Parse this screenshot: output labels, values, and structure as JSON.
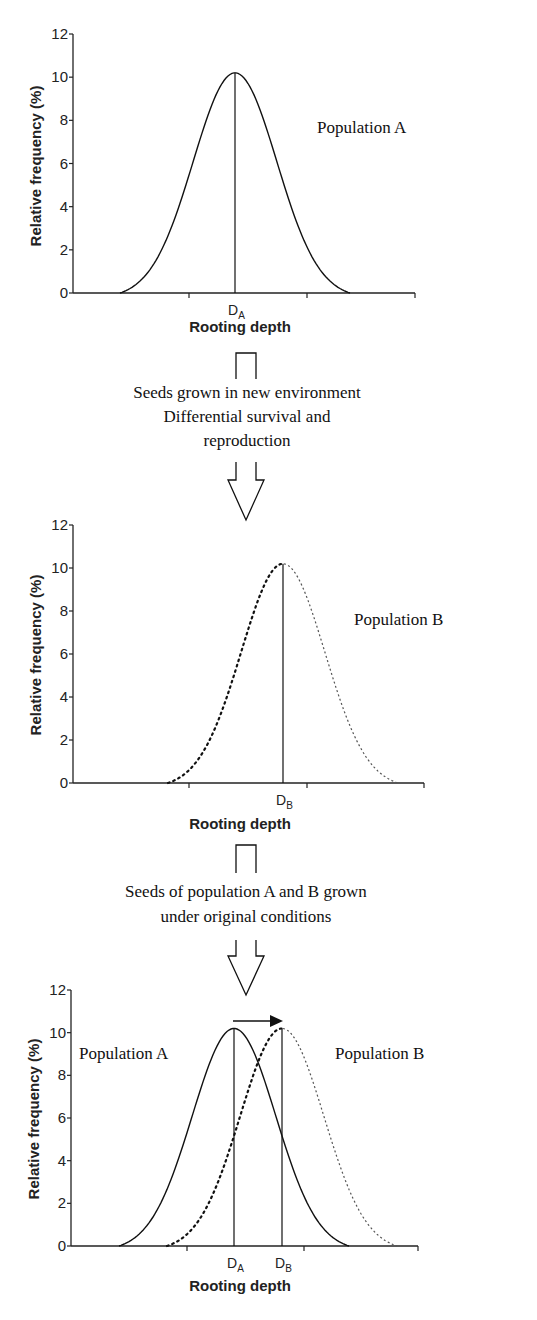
{
  "chart_data": [
    {
      "type": "line",
      "title": "",
      "xlabel": "Rooting depth",
      "ylabel": "Relative frequency (%)",
      "ylim": [
        0,
        12
      ],
      "yticks": [
        0,
        2,
        4,
        6,
        8,
        10,
        12
      ],
      "grid": false,
      "annotations": [
        "Population A"
      ],
      "x_marker_labels": [
        {
          "label": "D",
          "sub": "A"
        }
      ],
      "series": [
        {
          "name": "Population A",
          "style": "solid",
          "mean_label": "DA",
          "peak": 10.2,
          "x": [
            -4,
            -3,
            -2,
            -1,
            0,
            1,
            2,
            3,
            4
          ],
          "values": [
            0,
            1.2,
            4.0,
            8.0,
            10.2,
            8.0,
            4.0,
            1.2,
            0
          ]
        }
      ]
    },
    {
      "type": "line",
      "title": "",
      "xlabel": "Rooting depth",
      "ylabel": "Relative frequency (%)",
      "ylim": [
        0,
        12
      ],
      "yticks": [
        0,
        2,
        4,
        6,
        8,
        10,
        12
      ],
      "grid": false,
      "annotations": [
        "Population B"
      ],
      "x_marker_labels": [
        {
          "label": "D",
          "sub": "B"
        }
      ],
      "series": [
        {
          "name": "Population B",
          "style": "dotted",
          "mean_label": "DB",
          "peak": 10.2,
          "x": [
            -4,
            -3,
            -2,
            -1,
            0,
            1,
            2,
            3,
            4
          ],
          "values": [
            0,
            1.2,
            4.0,
            8.0,
            10.2,
            8.0,
            4.0,
            1.2,
            0
          ]
        }
      ]
    },
    {
      "type": "line",
      "title": "",
      "xlabel": "Rooting depth",
      "ylabel": "Relative frequency (%)",
      "ylim": [
        0,
        12
      ],
      "yticks": [
        0,
        2,
        4,
        6,
        8,
        10,
        12
      ],
      "grid": false,
      "annotations": [
        "Population A",
        "Population B",
        "arrow: shift from DA to DB"
      ],
      "x_marker_labels": [
        {
          "label": "D",
          "sub": "A"
        },
        {
          "label": "D",
          "sub": "B"
        }
      ],
      "series": [
        {
          "name": "Population A",
          "style": "solid",
          "mean_label": "DA",
          "peak": 10.2,
          "values": [
            0,
            1.2,
            4.0,
            8.0,
            10.2,
            8.0,
            4.0,
            1.2,
            0
          ]
        },
        {
          "name": "Population B",
          "style": "dotted",
          "mean_label": "DB",
          "peak": 10.2,
          "values": [
            0,
            1.2,
            4.0,
            8.0,
            10.2,
            8.0,
            4.0,
            1.2,
            0
          ]
        }
      ]
    }
  ],
  "labels": {
    "ylabel": "Relative frequency (%)",
    "xlabel": "Rooting depth",
    "yticks": [
      "0",
      "2",
      "4",
      "6",
      "8",
      "10",
      "12"
    ],
    "population_a": "Population A",
    "population_b": "Population B",
    "d": "D",
    "sub_a": "A",
    "sub_b": "B"
  },
  "captions": {
    "step1": [
      "Seeds grown in new environment",
      "Differential survival and",
      "reproduction"
    ],
    "step2": [
      "Seeds of population A and B grown",
      "under original conditions"
    ]
  },
  "layout": {
    "charts": [
      {
        "axis_x": 73,
        "x_end": 415,
        "y0": 293,
        "y12": 34,
        "ticks_x": [
          189,
          307
        ],
        "curves": [
          {
            "center": 235,
            "half_width": 115,
            "style": "solid"
          }
        ],
        "means": [
          {
            "x": 235,
            "sub": "A"
          }
        ],
        "label": {
          "text_key": "population_a",
          "x": 317,
          "y": 133
        },
        "xlabel_y": 332
      },
      {
        "axis_x": 73,
        "x_end": 424,
        "y0": 783,
        "y12": 525,
        "ticks_x": [
          189,
          307
        ],
        "curves": [
          {
            "center": 283,
            "half_width": 115,
            "style": "dotted"
          }
        ],
        "means": [
          {
            "x": 283,
            "sub": "B"
          }
        ],
        "label": {
          "text_key": "population_b",
          "x": 354,
          "y": 625
        },
        "xlabel_y": 829
      },
      {
        "axis_x": 71,
        "x_end": 418,
        "y0": 1246,
        "y12": 990,
        "ticks_x": [
          187,
          304
        ],
        "curves": [
          {
            "center": 234,
            "half_width": 115,
            "style": "solid"
          },
          {
            "center": 282,
            "half_width": 115,
            "style": "dotted"
          }
        ],
        "means": [
          {
            "x": 234,
            "sub": "A"
          },
          {
            "x": 282,
            "sub": "B"
          }
        ],
        "labels": [
          {
            "text_key": "population_a",
            "x": 79,
            "y": 1059
          },
          {
            "text_key": "population_b",
            "x": 335,
            "y": 1059
          }
        ],
        "arrow": {
          "x1": 233,
          "x2": 282,
          "y": 1021
        },
        "xlabel_y": 1291
      }
    ]
  }
}
